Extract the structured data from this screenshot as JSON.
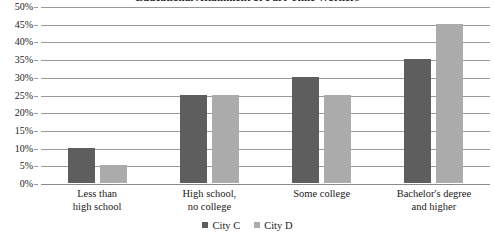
{
  "chart_data": {
    "type": "bar",
    "title": "Educational Attainment of Part-Time Workers",
    "xlabel": "",
    "ylabel": "",
    "ylim": [
      0,
      50
    ],
    "ytick_step": 5,
    "ytick_labels": [
      "50%",
      "45%",
      "40%",
      "35%",
      "30%",
      "25%",
      "20%",
      "15%",
      "10%",
      "5%",
      "0%"
    ],
    "ytick_values": [
      50,
      45,
      40,
      35,
      30,
      25,
      20,
      15,
      10,
      5,
      0
    ],
    "grid": true,
    "legend_position": "bottom",
    "categories": [
      [
        "Less than",
        "high school"
      ],
      [
        "High school,",
        "no college"
      ],
      [
        "Some college"
      ],
      [
        "Bachelor's degree",
        "and higher"
      ]
    ],
    "category_labels": [
      "Less than high school",
      "High school, no college",
      "Some college",
      "Bachelor's degree and higher"
    ],
    "series": [
      {
        "name": "City C",
        "color": "#5e5e5e",
        "values": [
          10,
          25,
          30,
          35
        ]
      },
      {
        "name": "City D",
        "color": "#ababab",
        "values": [
          5,
          25,
          25,
          45
        ]
      }
    ]
  }
}
